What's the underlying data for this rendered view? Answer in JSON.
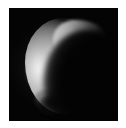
{
  "page": {
    "width_px": 126,
    "height_px": 128,
    "background_color": "#ffffff",
    "margin_color": "#ffffff"
  },
  "image_panel": {
    "label": "crescent body image",
    "background_color": "#050505",
    "left_px": 9,
    "top_px": 8,
    "width_px": 109,
    "height_px": 113
  },
  "subject": {
    "name": "illuminated crescent body",
    "description": "A partially illuminated spherical body shown as a bright crescent on a black sky background",
    "lit_side": "left",
    "terminator_orientation": "upper-left to lower-right diagonal",
    "brightest_region": "left limb, upper-middle",
    "brightest_value_hex": "#efefef",
    "darkest_value_hex": "#030303",
    "upper_horn": "extends toward upper right",
    "lower_horn": "ragged notch at bottom"
  },
  "colors": {
    "sky": "#050505",
    "highlight": "#efefef",
    "midtone": "#989898",
    "shadow": "#3a3a3a",
    "black": "#030303",
    "page": "#ffffff"
  }
}
